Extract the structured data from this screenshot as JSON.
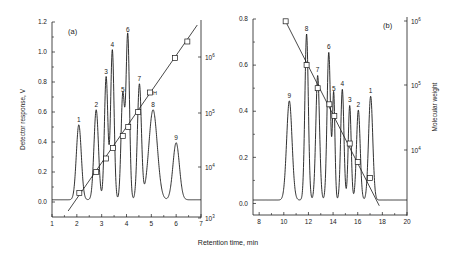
{
  "figure": {
    "xlabel": "Retention time, min",
    "line_color": "#1a1a1a",
    "text_color": "#222222"
  },
  "chart_data": [
    {
      "panel": "(a)",
      "type": "line",
      "title": "",
      "xlabel": "Retention time, min",
      "ylabel": "Detector response, V",
      "y2label": "",
      "xlim": [
        1,
        7
      ],
      "ylim": [
        -0.1,
        1.2
      ],
      "y2scale": "log",
      "y2lim_exp": [
        3,
        6.75
      ],
      "xticks": [
        1,
        2,
        3,
        4,
        5,
        6,
        7
      ],
      "yticks": [
        0.0,
        0.2,
        0.4,
        0.6,
        0.8,
        1.0,
        1.2
      ],
      "ytick_labels": [
        "0.0",
        "0.2",
        "0.4",
        "0.6",
        "0.8",
        "1.0",
        "1.2"
      ],
      "y2ticks": [
        "10^3",
        "10^4",
        "10^5",
        "10^6"
      ],
      "grid": false,
      "peaks": [
        {
          "label": "1",
          "t": 2.08,
          "height": 0.5,
          "width": 0.1
        },
        {
          "label": "2",
          "t": 2.78,
          "height": 0.6,
          "width": 0.09
        },
        {
          "label": "3",
          "t": 3.18,
          "height": 0.82,
          "width": 0.07
        },
        {
          "label": "4",
          "t": 3.43,
          "height": 1.0,
          "width": 0.07
        },
        {
          "label": "5",
          "t": 3.85,
          "height": 0.7,
          "width": 0.07
        },
        {
          "label": "6",
          "t": 4.05,
          "height": 1.1,
          "width": 0.07
        },
        {
          "label": "7",
          "t": 4.52,
          "height": 0.77,
          "width": 0.08
        },
        {
          "label": "8",
          "t": 5.07,
          "height": 0.6,
          "width": 0.17
        },
        {
          "label": "9",
          "t": 6.0,
          "height": 0.38,
          "width": 0.13
        }
      ],
      "baseline": 0.015,
      "baseline_start": 1.0,
      "baseline_end": 7.0,
      "calibration_points": [
        {
          "t": 2.1,
          "y": 0.06
        },
        {
          "t": 2.78,
          "y": 0.2
        },
        {
          "t": 3.18,
          "y": 0.29
        },
        {
          "t": 3.45,
          "y": 0.36
        },
        {
          "t": 3.85,
          "y": 0.44
        },
        {
          "t": 4.07,
          "y": 0.5
        },
        {
          "t": 4.47,
          "y": 0.6
        },
        {
          "t": 4.95,
          "y": 0.73,
          "label": "H"
        },
        {
          "t": 5.95,
          "y": 0.96
        },
        {
          "t": 6.45,
          "y": 1.07
        }
      ],
      "calibration_line": {
        "t0": 1.65,
        "y0": -0.06,
        "t1": 6.85,
        "y1": 1.18
      }
    },
    {
      "panel": "(b)",
      "type": "line",
      "title": "",
      "xlabel": "Retention time, min",
      "ylabel": "",
      "y2label": "Molecular weight",
      "xlim": [
        7.5,
        20
      ],
      "ylim": [
        -0.05,
        0.8
      ],
      "y2scale": "log",
      "xticks": [
        8,
        10,
        12,
        14,
        16,
        18,
        20
      ],
      "yticks": [
        0.0,
        0.2,
        0.4,
        0.6,
        0.8
      ],
      "ytick_labels": [
        "0.0",
        "0.2",
        "0.4",
        "0.6",
        "0.8"
      ],
      "y2ticks": [
        "10^4",
        "10^5",
        "10^6"
      ],
      "grid": false,
      "peaks": [
        {
          "label": "9",
          "t": 10.45,
          "height": 0.43,
          "width": 0.22
        },
        {
          "label": "8",
          "t": 11.85,
          "height": 0.72,
          "width": 0.14
        },
        {
          "label": "7",
          "t": 12.75,
          "height": 0.54,
          "width": 0.15
        },
        {
          "label": "6",
          "t": 13.65,
          "height": 0.64,
          "width": 0.14
        },
        {
          "label": "5",
          "t": 14.05,
          "height": 0.46,
          "width": 0.1
        },
        {
          "label": "4",
          "t": 14.75,
          "height": 0.48,
          "width": 0.13
        },
        {
          "label": "3",
          "t": 15.35,
          "height": 0.41,
          "width": 0.12
        },
        {
          "label": "2",
          "t": 16.05,
          "height": 0.39,
          "width": 0.15
        },
        {
          "label": "1",
          "t": 17.05,
          "height": 0.45,
          "width": 0.17
        }
      ],
      "baseline": 0.015,
      "baseline_start": 7.5,
      "baseline_end": 20.0,
      "calibration_points": [
        {
          "t": 10.15,
          "y": 0.79
        },
        {
          "t": 11.85,
          "y": 0.6
        },
        {
          "t": 12.75,
          "y": 0.5
        },
        {
          "t": 13.7,
          "y": 0.43
        },
        {
          "t": 14.1,
          "y": 0.38
        },
        {
          "t": 15.35,
          "y": 0.26
        },
        {
          "t": 16.0,
          "y": 0.18
        },
        {
          "t": 17.0,
          "y": 0.11
        }
      ],
      "calibration_line": {
        "t0": 10.05,
        "y0": 0.8,
        "t1": 17.75,
        "y1": -0.01
      }
    }
  ]
}
